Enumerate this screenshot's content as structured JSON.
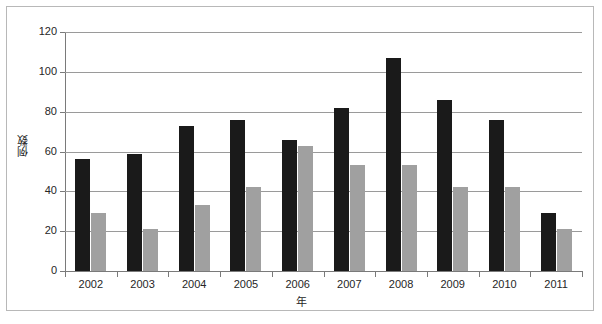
{
  "chart_data": {
    "type": "bar",
    "title": "",
    "subtitle": "",
    "xlabel": "年",
    "ylabel": "例数",
    "categories": [
      "2002",
      "2003",
      "2004",
      "2005",
      "2006",
      "2007",
      "2008",
      "2009",
      "2010",
      "2011"
    ],
    "series": [
      {
        "name": "series-1",
        "color": "#1a1a1a",
        "values": [
          56,
          59,
          73,
          76,
          66,
          82,
          107,
          86,
          76,
          29
        ]
      },
      {
        "name": "series-2",
        "color": "#a0a0a0",
        "values": [
          29,
          21,
          33,
          42,
          63,
          53,
          53,
          42,
          42,
          21
        ]
      }
    ],
    "ylim": [
      0,
      120
    ],
    "y_ticks": [
      0,
      20,
      40,
      60,
      80,
      100,
      120
    ],
    "y_tick_labels": [
      "0",
      "20",
      "40",
      "60",
      "80",
      "100",
      "120"
    ],
    "grid": true,
    "grid_axis": "y",
    "legend": "none",
    "legend_position": "none",
    "annotations": []
  },
  "frame": {
    "border_color": "#b8b8b8",
    "background": "#ffffff"
  }
}
